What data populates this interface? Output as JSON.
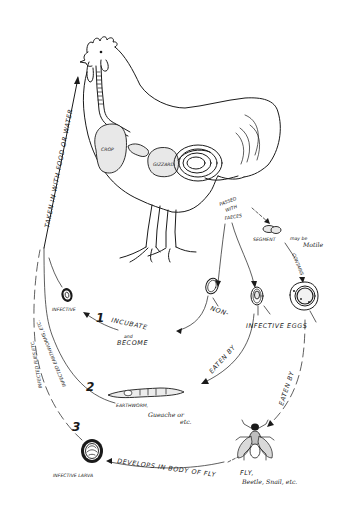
{
  "diagram": {
    "type": "life-cycle",
    "host": "rooster",
    "organs": {
      "crop_label": "CROP",
      "gizzard_label": "GIZZARD"
    },
    "labels": {
      "taken_in": "TAKEN IN WITH FOOD OR WATER",
      "passed_with": "PASSED",
      "passed_with_2": "WITH",
      "passed_with_3": "FAECES",
      "segment": "SEGMENT",
      "segment_note_1": "may be",
      "segment_note_2": "Motile",
      "contains": "CONTAINS",
      "non": "NON-",
      "infective_eggs": "INFECTIVE EGGS",
      "infective": "INFECTIVE",
      "incubate": "INCUBATE",
      "and": "and",
      "become": "BECOME",
      "eaten_by_1": "EATEN BY",
      "eaten_by_2": "EATEN BY",
      "earthworm": "EARTHWORM,",
      "earthworm_note_1": "Gueache or",
      "earthworm_note_2": "etc.",
      "infected_earthworms": "INFECTED EARTHWORMS, ETC.",
      "infected_flies": "INFECTED FLIES ETC.",
      "develops": "DEVELOPS IN BODY OF FLY",
      "fly": "FLY,",
      "fly_note": "Beetle, Snail, etc.",
      "infective_larva": "INFECTIVE LARVA"
    },
    "steps": [
      {
        "number": "1",
        "label": "Incubate and become infective"
      },
      {
        "number": "2",
        "label": "Eaten by earthworm"
      },
      {
        "number": "3",
        "label": "Develops in body of fly → infective larva"
      }
    ],
    "colors": {
      "ink": "#1a1a1a",
      "paper": "#ffffff",
      "stipple": "#e8e8e8"
    }
  }
}
